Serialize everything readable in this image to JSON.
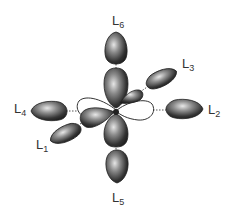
{
  "diagram": {
    "ligands": [
      {
        "id": "L1",
        "base": "L",
        "sub": "1"
      },
      {
        "id": "L2",
        "base": "L",
        "sub": "2"
      },
      {
        "id": "L3",
        "base": "L",
        "sub": "3"
      },
      {
        "id": "L4",
        "base": "L",
        "sub": "4"
      },
      {
        "id": "L5",
        "base": "L",
        "sub": "5"
      },
      {
        "id": "L6",
        "base": "L",
        "sub": "6"
      }
    ],
    "colors": {
      "lobe_dark": "#2a2a2a",
      "lobe_light": "#d8d8d8",
      "outline": "#333333",
      "dash": "#555555"
    }
  }
}
